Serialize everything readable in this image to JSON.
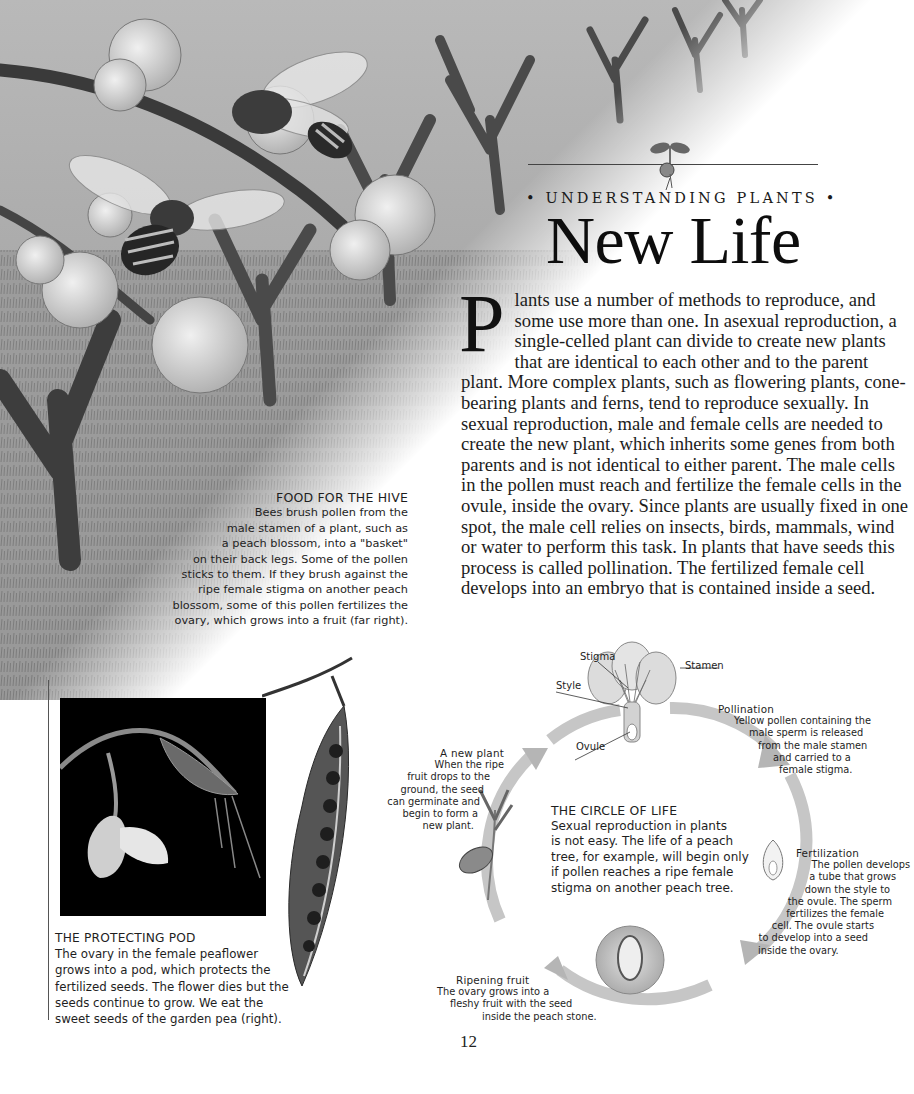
{
  "header": {
    "kicker": "• UNDERSTANDING PLANTS •",
    "title": "New Life"
  },
  "body": {
    "drop_cap": "P",
    "text": "lants use a number of methods to reproduce, and some use more than one. In asexual reproduction, a single-celled plant can divide to create new plants that are identical to each other and to the parent plant. More complex plants, such as flowering plants, cone-bearing plants and ferns, tend to reproduce sexually. In sexual reproduction, male and female cells are needed to create the new plant, which inherits some genes from both parents and is not identical to either parent. The male cells in the pollen must reach and fertilize the female cells in the ovule, inside the ovary. Since plants are usually fixed in one spot, the male cell relies on insects, birds, mammals, wind or water to perform this task. In plants that have seeds this process is called pollination. The fertilized female cell develops into an embryo that is contained inside a seed."
  },
  "food_caption": {
    "heading": "FOOD FOR THE HIVE",
    "lines": [
      "Bees brush pollen from the",
      "male stamen of a plant, such as",
      "a peach blossom, into a \"basket\"",
      "on their back legs. Some of the pollen",
      "sticks to them. If they brush against the",
      "ripe female stigma on another peach",
      "blossom, some of this pollen fertilizes the",
      "ovary, which grows into a fruit (far right)."
    ]
  },
  "pod_caption": {
    "heading": "THE PROTECTING POD",
    "lines": [
      "The ovary in the female peaflower",
      "grows into a pod, which protects the",
      "fertilized seeds. The flower dies but the",
      "seeds continue to grow. We eat the",
      "sweet seeds of the garden pea (right)."
    ]
  },
  "diagram": {
    "flower_labels": {
      "stigma": "Stigma",
      "stamen": "Stamen",
      "style": "Style",
      "ovule": "Ovule"
    },
    "pollination": {
      "heading": "Pollination",
      "lines": [
        "Yellow pollen containing the",
        "male sperm is released",
        "from the male stamen",
        "and carried to a",
        "female stigma."
      ]
    },
    "new_plant": {
      "heading": "A new plant",
      "lines": [
        "When the ripe",
        "fruit drops to the",
        "ground, the seed",
        "can germinate and",
        "begin to form a",
        "new plant."
      ]
    },
    "circle_of_life": {
      "heading": "THE CIRCLE OF LIFE",
      "lines": [
        "Sexual reproduction in plants",
        "is not easy. The life of a peach",
        "tree, for example, will begin only",
        "if pollen reaches a ripe female",
        "stigma on another peach tree."
      ]
    },
    "fertilization": {
      "heading": "Fertilization",
      "lines": [
        "The pollen develops",
        "a tube that grows",
        "down the style to",
        "the ovule. The sperm",
        "fertilizes the female",
        "cell. The ovule starts",
        "to develop into a seed",
        "inside the ovary."
      ]
    },
    "ripening": {
      "heading": "Ripening fruit",
      "lines": [
        "The ovary grows into a",
        "fleshy fruit with the seed",
        "inside the peach stone."
      ]
    }
  },
  "footer": {
    "page_number": "12"
  },
  "colors": {
    "text": "#1a1a1a",
    "cycle_arrow": "#c4c4c4",
    "photo_bg": "#000000",
    "rule": "#444444"
  }
}
